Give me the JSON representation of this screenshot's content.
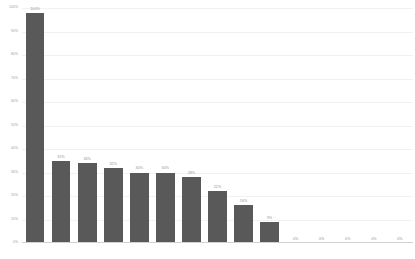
{
  "chart_data": {
    "type": "bar",
    "title": "",
    "subtitle": "",
    "xlabel": "",
    "ylabel": "",
    "ylim": [
      0,
      100
    ],
    "grid": true,
    "legend": false,
    "legend_position": "none",
    "bar_color": "#595959",
    "label_color": "#8f8f8f",
    "axis_color": "#9a9a9a",
    "gridline_color": "#f2f2f2",
    "baseline_color": "#d2d2d2",
    "categories": [
      "",
      "",
      "",
      "",
      "",
      "",
      "",
      "",
      "",
      "",
      "",
      "",
      "",
      "",
      ""
    ],
    "values": [
      100,
      35,
      34,
      32,
      30,
      30,
      28,
      22,
      16,
      9,
      0,
      0,
      0,
      0,
      0
    ],
    "data_labels": [
      "100%",
      "35%",
      "34%",
      "32%",
      "30%",
      "30%",
      "28%",
      "22%",
      "16%",
      "9%",
      "0%",
      "0%",
      "0%",
      "0%",
      "0%"
    ],
    "yticks": [
      100,
      90,
      80,
      70,
      60,
      50,
      40,
      30,
      20,
      10,
      0
    ],
    "ytick_labels": [
      "100%",
      "90%",
      "80%",
      "70%",
      "60%",
      "50%",
      "40%",
      "30%",
      "20%",
      "10%",
      "0%"
    ],
    "xtick_labels": []
  }
}
